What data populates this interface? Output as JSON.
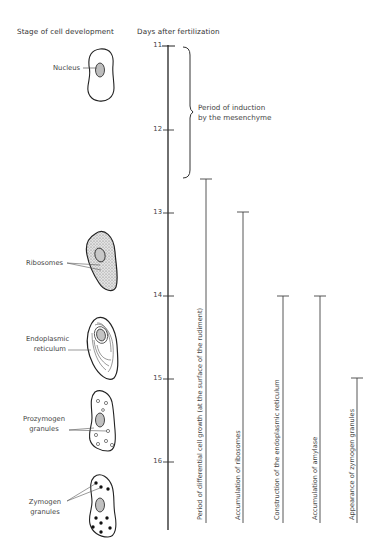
{
  "headers": {
    "left": "Stage of cell development",
    "right": "Days after fertilization"
  },
  "axis": {
    "ticks": [
      {
        "label": "11",
        "y": 46
      },
      {
        "label": "12",
        "y": 130
      },
      {
        "label": "13",
        "y": 213
      },
      {
        "label": "14",
        "y": 296
      },
      {
        "label": "15",
        "y": 379
      },
      {
        "label": "16",
        "y": 462
      }
    ]
  },
  "bracket": {
    "label_line1": "Period of induction",
    "label_line2": "by the mesenchyme",
    "from_day": 11,
    "to_day": 12.6
  },
  "bars": [
    {
      "label": "Period of differential cell growth (at the surface of the rudiment)",
      "start_day": 12.6
    },
    {
      "label": "Accumulation of ribosomes",
      "start_day": 13
    },
    {
      "label": "Construction of the endoplasmic reticulum",
      "start_day": 14
    },
    {
      "label": "Accumulation of amylase",
      "start_day": 14
    },
    {
      "label": "Appearance of zymogen granules",
      "start_day": 15
    }
  ],
  "cells": [
    {
      "label": "Nucleus"
    },
    {
      "label": "Ribosomes"
    },
    {
      "label_line1": "Endoplasmic",
      "label_line2": "reticulum"
    },
    {
      "label_line1": "Prozymogen",
      "label_line2": "granules"
    },
    {
      "label_line1": "Zymogen",
      "label_line2": "granules"
    }
  ]
}
